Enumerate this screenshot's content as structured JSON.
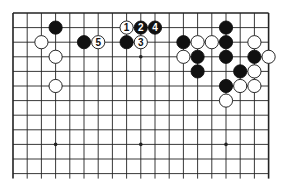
{
  "diagram": {
    "type": "go-board-partial",
    "columns": 19,
    "visible_rows": 12,
    "origin": {
      "x": 13,
      "y": 13
    },
    "spacing": {
      "x": 14.2,
      "y": 14.6
    },
    "bottom_open": true,
    "star_points": [
      [
        3,
        3
      ],
      [
        9,
        3
      ],
      [
        15,
        3
      ],
      [
        3,
        9
      ],
      [
        9,
        9
      ],
      [
        15,
        9
      ]
    ],
    "colors": {
      "line": "#222222",
      "black": "#111111",
      "white": "#ffffff",
      "background": "#ffffff"
    },
    "stones": [
      {
        "col": 3,
        "row": 1,
        "color": "black"
      },
      {
        "col": 2,
        "row": 2,
        "color": "white"
      },
      {
        "col": 3,
        "row": 3,
        "color": "white"
      },
      {
        "col": 3,
        "row": 5,
        "color": "white"
      },
      {
        "col": 5,
        "row": 2,
        "color": "black"
      },
      {
        "col": 6,
        "row": 2,
        "color": "white",
        "label": "5"
      },
      {
        "col": 8,
        "row": 1,
        "color": "white",
        "label": "1"
      },
      {
        "col": 9,
        "row": 1,
        "color": "black",
        "label": "2"
      },
      {
        "col": 10,
        "row": 1,
        "color": "black",
        "label": "4"
      },
      {
        "col": 8,
        "row": 2,
        "color": "black"
      },
      {
        "col": 9,
        "row": 2,
        "color": "white",
        "label": "3"
      },
      {
        "col": 12,
        "row": 2,
        "color": "black"
      },
      {
        "col": 13,
        "row": 2,
        "color": "white"
      },
      {
        "col": 14,
        "row": 2,
        "color": "white"
      },
      {
        "col": 15,
        "row": 1,
        "color": "black"
      },
      {
        "col": 15,
        "row": 2,
        "color": "black"
      },
      {
        "col": 15,
        "row": 3,
        "color": "black"
      },
      {
        "col": 12,
        "row": 3,
        "color": "white"
      },
      {
        "col": 13,
        "row": 3,
        "color": "black"
      },
      {
        "col": 13,
        "row": 4,
        "color": "black"
      },
      {
        "col": 17,
        "row": 2,
        "color": "white"
      },
      {
        "col": 17,
        "row": 3,
        "color": "black"
      },
      {
        "col": 18,
        "row": 3,
        "color": "white"
      },
      {
        "col": 16,
        "row": 4,
        "color": "black"
      },
      {
        "col": 17,
        "row": 4,
        "color": "white"
      },
      {
        "col": 15,
        "row": 5,
        "color": "black"
      },
      {
        "col": 16,
        "row": 5,
        "color": "white"
      },
      {
        "col": 17,
        "row": 5,
        "color": "white"
      },
      {
        "col": 15,
        "row": 6,
        "color": "white"
      }
    ]
  }
}
